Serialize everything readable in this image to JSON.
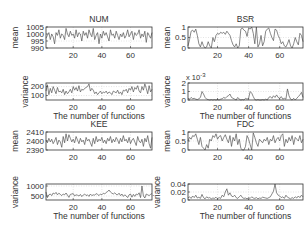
{
  "figure": {
    "background": "#ffffff",
    "line_color": "#555555",
    "axis_color": "#333333",
    "grid_color": "#c8c8c8"
  },
  "chart_data": [
    {
      "type": "line",
      "title": "NUM",
      "xlabel": "",
      "ylabel": "mean",
      "xlim": [
        1,
        75
      ],
      "ylim": [
        990,
        1005
      ],
      "yticks": [
        990,
        995,
        1000,
        1005
      ],
      "xticks": [
        20,
        40,
        60
      ],
      "grid": "dotted",
      "box": {
        "x": 46,
        "y": 27,
        "w": 106,
        "h": 21
      },
      "x": [
        1,
        2,
        3,
        4,
        5,
        6,
        7,
        8,
        9,
        10,
        11,
        12,
        13,
        14,
        15,
        16,
        17,
        18,
        19,
        20,
        21,
        22,
        23,
        24,
        25,
        26,
        27,
        28,
        29,
        30,
        31,
        32,
        33,
        34,
        35,
        36,
        37,
        38,
        39,
        40,
        41,
        42,
        43,
        44,
        45,
        46,
        47,
        48,
        49,
        50,
        51,
        52,
        53,
        54,
        55,
        56,
        57,
        58,
        59,
        60,
        61,
        62,
        63,
        64,
        65,
        66,
        67,
        68,
        69,
        70,
        71,
        72,
        73,
        74,
        75
      ],
      "values": [
        997,
        999,
        1001,
        996,
        1000,
        998,
        993,
        1001,
        999,
        1003,
        997,
        1000,
        999,
        996,
        1004,
        1000,
        998,
        1002,
        999,
        1000,
        997,
        1003,
        998,
        1001,
        1000,
        995,
        1002,
        999,
        1001,
        997,
        1003,
        1000,
        998,
        1004,
        996,
        999,
        1001,
        993,
        1000,
        997,
        1002,
        999,
        1001,
        998,
        995,
        1003,
        999,
        1000,
        997,
        1002,
        999,
        996,
        1000,
        998,
        1001,
        997,
        999,
        1003,
        998,
        1000,
        1002,
        996,
        1001,
        999,
        1000,
        1003,
        997,
        1000,
        998,
        1002,
        994,
        1001,
        999,
        997,
        1001
      ]
    },
    {
      "type": "line",
      "title": "",
      "xlabel": "The number of functions",
      "ylabel": "variance",
      "xlim": [
        1,
        75
      ],
      "ylim": [
        50,
        240
      ],
      "yticks": [
        100,
        200
      ],
      "xticks": [
        20,
        40,
        60
      ],
      "grid": "dotted",
      "box": {
        "x": 46,
        "y": 83,
        "w": 106,
        "h": 17
      },
      "x": [
        1,
        2,
        3,
        4,
        5,
        6,
        7,
        8,
        9,
        10,
        11,
        12,
        13,
        14,
        15,
        16,
        17,
        18,
        19,
        20,
        21,
        22,
        23,
        24,
        25,
        26,
        27,
        28,
        29,
        30,
        31,
        32,
        33,
        34,
        35,
        36,
        37,
        38,
        39,
        40,
        41,
        42,
        43,
        44,
        45,
        46,
        47,
        48,
        49,
        50,
        51,
        52,
        53,
        54,
        55,
        56,
        57,
        58,
        59,
        60,
        61,
        62,
        63,
        64,
        65,
        66,
        67,
        68,
        69,
        70,
        71,
        72,
        73,
        74,
        75
      ],
      "values": [
        150,
        220,
        110,
        180,
        130,
        200,
        160,
        120,
        190,
        140,
        150,
        130,
        170,
        110,
        150,
        120,
        140,
        170,
        130,
        200,
        160,
        190,
        150,
        210,
        140,
        170,
        160,
        180,
        190,
        200,
        230,
        150,
        180,
        160,
        120,
        140,
        110,
        130,
        150,
        120,
        140,
        130,
        150,
        120,
        140,
        130,
        110,
        150,
        140,
        130,
        160,
        120,
        140,
        110,
        160,
        150,
        170,
        130,
        180,
        160,
        200,
        140,
        190,
        170,
        210,
        150,
        130,
        200,
        160,
        230,
        180,
        120,
        210,
        140,
        170
      ]
    },
    {
      "type": "line",
      "title": "BSR",
      "xlabel": "",
      "ylabel": "mean",
      "xlim": [
        1,
        75
      ],
      "ylim": [
        0,
        1
      ],
      "yticks": [
        0,
        0.5,
        1
      ],
      "xticks": [
        20,
        40,
        60
      ],
      "grid": "dotted",
      "box": {
        "x": 188,
        "y": 27,
        "w": 115,
        "h": 21
      },
      "x": [
        1,
        2,
        3,
        4,
        5,
        6,
        7,
        8,
        9,
        10,
        11,
        12,
        13,
        14,
        15,
        16,
        17,
        18,
        19,
        20,
        21,
        22,
        23,
        24,
        25,
        26,
        27,
        28,
        29,
        30,
        31,
        32,
        33,
        34,
        35,
        36,
        37,
        38,
        39,
        40,
        41,
        42,
        43,
        44,
        45,
        46,
        47,
        48,
        49,
        50,
        51,
        52,
        53,
        54,
        55,
        56,
        57,
        58,
        59,
        60,
        61,
        62,
        63,
        64,
        65,
        66,
        67,
        68,
        69,
        70,
        71,
        72,
        73,
        74,
        75
      ],
      "values": [
        0.1,
        0.4,
        0.8,
        0.85,
        0.75,
        0.9,
        0.6,
        0.2,
        0.05,
        0.3,
        0.1,
        0.0,
        0.05,
        0.3,
        0.1,
        0.0,
        0.5,
        0.3,
        0.6,
        0.7,
        0.65,
        0.75,
        0.7,
        0.75,
        0.65,
        0.8,
        0.7,
        0.6,
        0.35,
        0.15,
        0.05,
        0.2,
        0.0,
        0.1,
        0.9,
        0.95,
        0.85,
        0.8,
        0.55,
        0.95,
        0.9,
        1.0,
        0.7,
        0.2,
        1.0,
        0.05,
        0.2,
        0.6,
        0.1,
        0.3,
        0.8,
        0.9,
        0.95,
        0.7,
        0.5,
        0.35,
        0.9,
        0.85,
        0.6,
        0.45,
        0.2,
        0.3,
        0.1,
        0.05,
        0.2,
        0.4,
        0.1,
        0.0,
        0.2,
        0.5,
        0.3,
        0.15,
        0.7,
        0.6,
        0.3
      ]
    },
    {
      "type": "line",
      "title": "",
      "xlabel": "The number of functions",
      "ylabel": "variance",
      "yscale_label": "x 10^-3",
      "xlim": [
        1,
        75
      ],
      "ylim": [
        0,
        2
      ],
      "yticks": [
        0,
        1,
        2
      ],
      "xticks": [
        20,
        40,
        60
      ],
      "grid": "dotted",
      "box": {
        "x": 188,
        "y": 83,
        "w": 115,
        "h": 17
      },
      "x": [
        1,
        2,
        3,
        4,
        5,
        6,
        7,
        8,
        9,
        10,
        11,
        12,
        13,
        14,
        15,
        16,
        17,
        18,
        19,
        20,
        21,
        22,
        23,
        24,
        25,
        26,
        27,
        28,
        29,
        30,
        31,
        32,
        33,
        34,
        35,
        36,
        37,
        38,
        39,
        40,
        41,
        42,
        43,
        44,
        45,
        46,
        47,
        48,
        49,
        50,
        51,
        52,
        53,
        54,
        55,
        56,
        57,
        58,
        59,
        60,
        61,
        62,
        63,
        64,
        65,
        66,
        67,
        68,
        69,
        70,
        71,
        72,
        73,
        74,
        75
      ],
      "values": [
        0.2,
        0.1,
        0.3,
        0.15,
        0.2,
        0.1,
        0.05,
        0.15,
        0.3,
        1.0,
        0.7,
        0.3,
        0.1,
        0.05,
        0.0,
        0.05,
        0.0,
        0.05,
        0.0,
        0.05,
        0.0,
        0.1,
        0.15,
        0.3,
        0.2,
        0.4,
        0.5,
        0.7,
        0.3,
        0.2,
        0.1,
        0.0,
        0.3,
        0.1,
        0.0,
        0.05,
        0.0,
        0.2,
        0.1,
        0.2,
        1.0,
        0.8,
        0.4,
        0.05,
        0.0,
        0.05,
        0.0,
        0.0,
        0.05,
        0.0,
        0.1,
        0.0,
        0.3,
        0.4,
        0.2,
        0.5,
        0.3,
        0.6,
        0.3,
        0.2,
        0.4,
        0.1,
        0.2,
        0.1,
        1.3,
        0.5,
        0.1,
        0.0,
        0.2,
        0.0,
        0.2,
        0.4,
        0.6,
        0.9,
        0.3
      ]
    },
    {
      "type": "line",
      "title": "KEE",
      "xlabel": "",
      "ylabel": "mean",
      "xlim": [
        1,
        75
      ],
      "ylim": [
        2390,
        2410
      ],
      "yticks": [
        2390,
        2400,
        2410
      ],
      "xticks": [
        20,
        40,
        60
      ],
      "grid": "dotted",
      "box": {
        "x": 46,
        "y": 132,
        "w": 106,
        "h": 18
      },
      "x": [
        1,
        2,
        3,
        4,
        5,
        6,
        7,
        8,
        9,
        10,
        11,
        12,
        13,
        14,
        15,
        16,
        17,
        18,
        19,
        20,
        21,
        22,
        23,
        24,
        25,
        26,
        27,
        28,
        29,
        30,
        31,
        32,
        33,
        34,
        35,
        36,
        37,
        38,
        39,
        40,
        41,
        42,
        43,
        44,
        45,
        46,
        47,
        48,
        49,
        50,
        51,
        52,
        53,
        54,
        55,
        56,
        57,
        58,
        59,
        60,
        61,
        62,
        63,
        64,
        65,
        66,
        67,
        68,
        69,
        70,
        71,
        72,
        73,
        74,
        75
      ],
      "values": [
        2401,
        2398,
        2403,
        2399,
        2402,
        2397,
        2400,
        2404,
        2396,
        2401,
        2399,
        2393,
        2405,
        2398,
        2408,
        2400,
        2407,
        2403,
        2399,
        2402,
        2398,
        2405,
        2401,
        2397,
        2403,
        2399,
        2401,
        2396,
        2404,
        2400,
        2402,
        2398,
        2394,
        2403,
        2397,
        2405,
        2399,
        2402,
        2400,
        2404,
        2398,
        2401,
        2397,
        2403,
        2400,
        2405,
        2398,
        2402,
        2399,
        2404,
        2401,
        2397,
        2403,
        2399,
        2406,
        2400,
        2402,
        2398,
        2404,
        2397,
        2401,
        2403,
        2399,
        2395,
        2405,
        2400,
        2398,
        2402,
        2394,
        2403,
        2399,
        2406,
        2397,
        2392,
        2404
      ]
    },
    {
      "type": "line",
      "title": "",
      "xlabel": "The number of functions",
      "ylabel": "variance",
      "xlim": [
        1,
        75
      ],
      "ylim": [
        300,
        1100
      ],
      "yticks": [
        500,
        1000
      ],
      "xticks": [
        20,
        40,
        60
      ],
      "grid": "dotted",
      "box": {
        "x": 46,
        "y": 184,
        "w": 106,
        "h": 16
      },
      "x": [
        1,
        2,
        3,
        4,
        5,
        6,
        7,
        8,
        9,
        10,
        11,
        12,
        13,
        14,
        15,
        16,
        17,
        18,
        19,
        20,
        21,
        22,
        23,
        24,
        25,
        26,
        27,
        28,
        29,
        30,
        31,
        32,
        33,
        34,
        35,
        36,
        37,
        38,
        39,
        40,
        41,
        42,
        43,
        44,
        45,
        46,
        47,
        48,
        49,
        50,
        51,
        52,
        53,
        54,
        55,
        56,
        57,
        58,
        59,
        60,
        61,
        62,
        63,
        64,
        65,
        66,
        67,
        68,
        69,
        70,
        71,
        72,
        73,
        74,
        75
      ],
      "values": [
        700,
        420,
        560,
        600,
        520,
        650,
        600,
        680,
        560,
        640,
        580,
        520,
        600,
        560,
        650,
        540,
        430,
        580,
        600,
        620,
        500,
        560,
        540,
        500,
        580,
        470,
        550,
        600,
        520,
        560,
        480,
        600,
        520,
        560,
        540,
        620,
        580,
        520,
        600,
        560,
        640,
        600,
        680,
        720,
        800,
        700,
        640,
        600,
        660,
        580,
        560,
        640,
        520,
        600,
        480,
        560,
        500,
        420,
        560,
        600,
        440,
        580,
        480,
        600,
        560,
        660,
        420,
        1000,
        500,
        400,
        600,
        560,
        520,
        580,
        620
      ]
    },
    {
      "type": "line",
      "title": "FDC",
      "xlabel": "",
      "ylabel": "mean",
      "xlim": [
        1,
        75
      ],
      "ylim": [
        0,
        1
      ],
      "yticks": [
        0,
        0.5,
        1
      ],
      "xticks": [
        20,
        40,
        60
      ],
      "grid": "dotted",
      "box": {
        "x": 188,
        "y": 132,
        "w": 115,
        "h": 18
      },
      "x": [
        1,
        2,
        3,
        4,
        5,
        6,
        7,
        8,
        9,
        10,
        11,
        12,
        13,
        14,
        15,
        16,
        17,
        18,
        19,
        20,
        21,
        22,
        23,
        24,
        25,
        26,
        27,
        28,
        29,
        30,
        31,
        32,
        33,
        34,
        35,
        36,
        37,
        38,
        39,
        40,
        41,
        42,
        43,
        44,
        45,
        46,
        47,
        48,
        49,
        50,
        51,
        52,
        53,
        54,
        55,
        56,
        57,
        58,
        59,
        60,
        61,
        62,
        63,
        64,
        65,
        66,
        67,
        68,
        69,
        70,
        71,
        72,
        73,
        74,
        75
      ],
      "values": [
        0.5,
        0.7,
        0.6,
        0.8,
        0.75,
        0.9,
        0.6,
        0.3,
        0.7,
        0.2,
        0.1,
        0.0,
        0.3,
        0.1,
        0.6,
        0.5,
        0.8,
        0.7,
        0.9,
        0.6,
        0.75,
        0.8,
        0.5,
        0.7,
        0.85,
        0.6,
        0.4,
        0.8,
        0.2,
        0.7,
        0.5,
        0.9,
        0.3,
        0.6,
        0.1,
        0.0,
        0.0,
        0.2,
        0.8,
        0.6,
        0.3,
        0.0,
        0.95,
        0.7,
        0.4,
        0.2,
        0.6,
        0.5,
        0.4,
        0.6,
        0.5,
        0.7,
        0.3,
        0.6,
        0.5,
        0.8,
        0.4,
        0.6,
        0.7,
        0.5,
        0.8,
        0.9,
        0.2,
        0.6,
        0.4,
        0.7,
        0.5,
        0.8,
        0.3,
        0.7,
        0.6,
        0.5,
        0.8,
        0.4,
        0.6
      ]
    },
    {
      "type": "line",
      "title": "",
      "xlabel": "The number of functions",
      "ylabel": "variance",
      "xlim": [
        1,
        75
      ],
      "ylim": [
        0,
        0.04
      ],
      "yticks": [
        0,
        0.02,
        0.04
      ],
      "xticks": [
        20,
        40,
        60
      ],
      "grid": "dotted",
      "box": {
        "x": 188,
        "y": 184,
        "w": 115,
        "h": 16
      },
      "x": [
        1,
        2,
        3,
        4,
        5,
        6,
        7,
        8,
        9,
        10,
        11,
        12,
        13,
        14,
        15,
        16,
        17,
        18,
        19,
        20,
        21,
        22,
        23,
        24,
        25,
        26,
        27,
        28,
        29,
        30,
        31,
        32,
        33,
        34,
        35,
        36,
        37,
        38,
        39,
        40,
        41,
        42,
        43,
        44,
        45,
        46,
        47,
        48,
        49,
        50,
        51,
        52,
        53,
        54,
        55,
        56,
        57,
        58,
        59,
        60,
        61,
        62,
        63,
        64,
        65,
        66,
        67,
        68,
        69,
        70,
        71,
        72,
        73,
        74,
        75
      ],
      "values": [
        0.005,
        0.008,
        0.004,
        0.01,
        0.006,
        0.012,
        0.005,
        0.007,
        0.004,
        0.014,
        0.006,
        0.003,
        0.008,
        0.005,
        0.006,
        0.003,
        0.005,
        0.004,
        0.007,
        0.003,
        0.006,
        0.004,
        0.012,
        0.008,
        0.02,
        0.028,
        0.012,
        0.018,
        0.01,
        0.008,
        0.012,
        0.006,
        0.004,
        0.008,
        0.012,
        0.006,
        0.004,
        0.005,
        0.003,
        0.006,
        0.004,
        0.008,
        0.005,
        0.004,
        0.006,
        0.003,
        0.005,
        0.004,
        0.007,
        0.006,
        0.005,
        0.004,
        0.006,
        0.008,
        0.015,
        0.022,
        0.04,
        0.018,
        0.012,
        0.01,
        0.006,
        0.008,
        0.004,
        0.012,
        0.007,
        0.005,
        0.003,
        0.006,
        0.004,
        0.008,
        0.005,
        0.01,
        0.006,
        0.012,
        0.008
      ]
    }
  ]
}
